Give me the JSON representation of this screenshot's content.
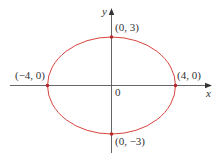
{
  "diagram": {
    "type": "ellipse-on-axes",
    "colors": {
      "axis": "#555555",
      "curve": "#d8453e",
      "point": "#b8262a",
      "text": "#333333"
    },
    "axes": {
      "x_label": "x",
      "y_label": "y",
      "origin_label": "0"
    },
    "ellipse": {
      "center": [
        0,
        0
      ],
      "a": 4,
      "b": 3
    },
    "points": [
      {
        "label": "(0, 3)",
        "coords": [
          0,
          3
        ]
      },
      {
        "label": "(4, 0)",
        "coords": [
          4,
          0
        ]
      },
      {
        "label": "(−4, 0)",
        "coords": [
          -4,
          0
        ]
      },
      {
        "label": "(0, −3)",
        "coords": [
          0,
          -3
        ]
      }
    ]
  }
}
